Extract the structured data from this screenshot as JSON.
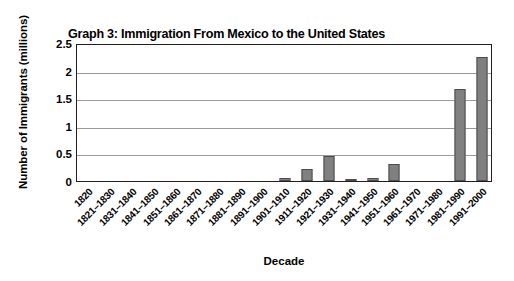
{
  "chart_data": {
    "type": "bar",
    "title": "Graph 3: Immigration From Mexico to the United States",
    "xlabel": "Decade",
    "ylabel": "Number of Immigrants (millions)",
    "ylim": [
      0,
      2.5
    ],
    "yticks": [
      "0",
      "0.5",
      "1",
      "1.5",
      "2",
      "2.5"
    ],
    "ytick_values": [
      0,
      0.5,
      1,
      1.5,
      2,
      2.5
    ],
    "grid": true,
    "legend": "none",
    "bar_color": "#808080",
    "bar_edge_color": "#4d4d4d",
    "axis_color": "#231f20",
    "gridline_color": "#9a9a9a",
    "categories": [
      "1820",
      "1821–1830",
      "1831–1840",
      "1841–1850",
      "1851–1860",
      "1861–1870",
      "1871–1880",
      "1881–1890",
      "1891–1900",
      "1901–1910",
      "1911–1920",
      "1921–1930",
      "1931–1940",
      "1941–1950",
      "1951–1960",
      "1961–1970",
      "1971–1980",
      "1981–1990",
      "1991–2000"
    ],
    "values": [
      0,
      0,
      0,
      0,
      0,
      0,
      0,
      0,
      0,
      0.05,
      0.22,
      0.46,
      0.02,
      0.06,
      0.3,
      0,
      0,
      1.66,
      2.25
    ]
  }
}
